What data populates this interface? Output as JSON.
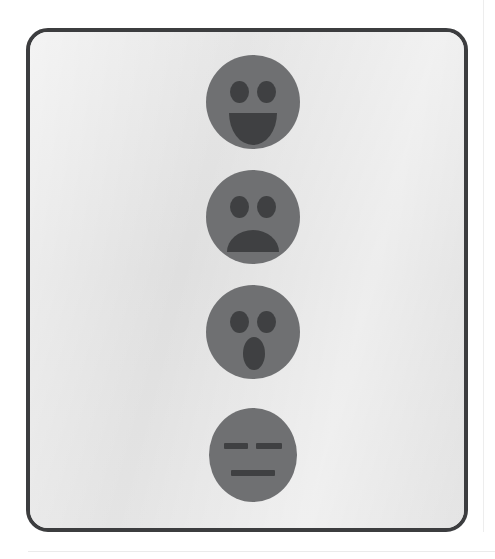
{
  "image": {
    "title": "Emoticon face icon set",
    "description": "Four grey round emoticon faces stacked vertically inside a rounded dark-bordered panel",
    "background_color": "#ffffff"
  },
  "panel": {
    "name": "rounded-frame-panel",
    "border_color": "#3c3d3f",
    "fill_color": "#e3e3e3",
    "border_radius": "22px",
    "border_width": "4px"
  },
  "palette": {
    "face_fill": "#6f7072",
    "feature_fill": "#3f4042",
    "panel_fill": "#e3e3e3",
    "frame_stroke": "#3c3d3f",
    "page_background": "#ffffff",
    "page_rule": "#ededed"
  },
  "faces": [
    {
      "id": "face-happy",
      "label": "Happy face",
      "expression": "happy",
      "mouth": "smile",
      "eyes": "oval",
      "order": 1,
      "diameter_px": 94
    },
    {
      "id": "face-sad",
      "label": "Sad face",
      "expression": "sad",
      "mouth": "frown",
      "eyes": "oval",
      "order": 2,
      "diameter_px": 94
    },
    {
      "id": "face-surprised",
      "label": "Surprised face",
      "expression": "surprised",
      "mouth": "open-oval",
      "eyes": "oval",
      "order": 3,
      "diameter_px": 94
    },
    {
      "id": "face-neutral",
      "label": "Neutral face",
      "expression": "neutral",
      "mouth": "straight-line",
      "eyes": "line",
      "order": 4,
      "diameter_px": 88
    }
  ]
}
